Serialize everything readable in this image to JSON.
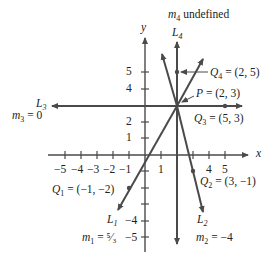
{
  "diagram": {
    "axes": {
      "x_label": "x",
      "y_label": "y",
      "x_ticks_labeled": [
        "-5",
        "-4",
        "-3",
        "-2",
        "-1",
        "1",
        "4",
        "5"
      ],
      "y_ticks_labeled": [
        "5",
        "4",
        "2",
        "1",
        "-4",
        "-5"
      ]
    },
    "point_P": "P = (2, 3)",
    "lines": [
      {
        "name": "L1",
        "slope_label": "m1 = 5/3",
        "point": "Q1 = (-1, -2)"
      },
      {
        "name": "L2",
        "slope_label": "m2 = -4",
        "point": "Q2 = (3, -1)"
      },
      {
        "name": "L3",
        "slope_label": "m3 = 0",
        "point": "Q3 = (5, 3)"
      },
      {
        "name": "L4",
        "slope_label": "m4 undefined",
        "point": "Q4 = (2, 5)"
      }
    ],
    "text": {
      "y": "y",
      "x": "x",
      "m4": "m",
      "m4_sub": "4",
      "m4_rest": " undefined",
      "L4": "L",
      "L4_sub": "4",
      "Q4": "Q",
      "Q4_sub": "4",
      "Q4_rest": " = (2, 5)",
      "P": "P",
      "P_rest": " = (2, 3)",
      "L3": "L",
      "L3_sub": "3",
      "m3": "m",
      "m3_sub": "3",
      "m3_rest": " = 0",
      "Q3": "Q",
      "Q3_sub": "3",
      "Q3_rest": " = (5, 3)",
      "Q1": "Q",
      "Q1_sub": "1",
      "Q1_rest": " = (−1, −2)",
      "Q2": "Q",
      "Q2_sub": "2",
      "Q2_rest": " = (3, −1)",
      "L1": "L",
      "L1_sub": "1",
      "m1": "m",
      "m1_sub": "1",
      "m1_rest": " = ⁵⁄₃",
      "L2": "L",
      "L2_sub": "2",
      "m2": "m",
      "m2_sub": "2",
      "m2_rest": " = −4",
      "xt": [
        "−5",
        "−4",
        "−3",
        "−2",
        "−1",
        "1",
        "4",
        "5"
      ],
      "yt": [
        "5",
        "4",
        "2",
        "1",
        "−4",
        "−5"
      ]
    },
    "colors": {
      "line": "#4a4a4a",
      "text": "#222222"
    }
  }
}
